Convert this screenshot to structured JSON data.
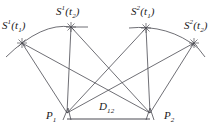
{
  "figure": {
    "background_color": "#ffffff",
    "line_color": "#4a4a52",
    "text_color": "#1a1a1a",
    "width": 223,
    "height": 134
  },
  "nodes": [
    {
      "id": "s1t1",
      "label_base": "S",
      "label_sup": "1",
      "label_arg": "t",
      "label_sub": "1",
      "x": 22,
      "y": 43,
      "label_x": 2,
      "label_y": 20
    },
    {
      "id": "s1t2",
      "label_base": "S",
      "label_sup": "1",
      "label_arg": "t",
      "label_sub": "2",
      "x": 71,
      "y": 27,
      "label_x": 56,
      "label_y": 6
    },
    {
      "id": "s2t1",
      "label_base": "S",
      "label_sup": "2",
      "label_arg": "t",
      "label_sub": "1",
      "x": 146,
      "y": 28,
      "label_x": 131,
      "label_y": 6
    },
    {
      "id": "s2t2",
      "label_base": "S",
      "label_sup": "2",
      "label_arg": "t",
      "label_sub": "2",
      "x": 194,
      "y": 43,
      "label_x": 184,
      "label_y": 20
    },
    {
      "id": "p1",
      "label_base": "P",
      "label_sup": "",
      "label_arg": "",
      "label_sub": "1",
      "x": 67,
      "y": 113,
      "label_x": 46,
      "label_y": 110
    },
    {
      "id": "p2",
      "label_base": "P",
      "label_sup": "",
      "label_arg": "",
      "label_sub": "2",
      "x": 150,
      "y": 113,
      "label_x": 164,
      "label_y": 110
    }
  ],
  "baseline": {
    "id": "d12",
    "label_base": "D",
    "label_sub": "12",
    "from": "p1",
    "to": "p2",
    "label_x": 99,
    "label_y": 101
  },
  "labels": {
    "s1t1": "S¹(t₁)",
    "s1t2": "S¹(t₂)",
    "s2t1": "S²(t₁)",
    "s2t2": "S²(t₂)",
    "p1": "P₁",
    "p2": "P₂",
    "d12": "D₁₂"
  },
  "edges": [
    {
      "name": "s1t1-to-p1",
      "from": "s1t1",
      "to": "p1"
    },
    {
      "name": "s1t1-to-p2",
      "from": "s1t1",
      "to": "p2"
    },
    {
      "name": "s1t2-to-p1",
      "from": "s1t2",
      "to": "p1"
    },
    {
      "name": "s1t2-to-p2",
      "from": "s1t2",
      "to": "p2"
    },
    {
      "name": "s2t1-to-p1",
      "from": "s2t1",
      "to": "p1"
    },
    {
      "name": "s2t1-to-p2",
      "from": "s2t1",
      "to": "p2"
    },
    {
      "name": "s2t2-to-p1",
      "from": "s2t2",
      "to": "p1"
    },
    {
      "name": "s2t2-to-p2",
      "from": "s2t2",
      "to": "p2"
    },
    {
      "name": "baseline-p1-p2",
      "from": "p1",
      "to": "p2"
    }
  ],
  "arcs": [
    {
      "name": "orbit-arc-satellite-1",
      "description": "arc through S1(t1) and S1(t2)"
    },
    {
      "name": "orbit-arc-satellite-2",
      "description": "arc through S2(t1) and S2(t2)"
    }
  ]
}
